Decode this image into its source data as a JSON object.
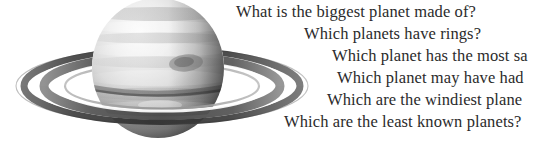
{
  "figure": {
    "illustration": {
      "name": "saturn-planet-with-rings",
      "description": "Grayscale photographic illustration of the ringed gas giant Saturn, body cropped at the top edge, rings tilted and extending to the left and right",
      "colors": {
        "background": "#ffffff",
        "planet_light": "#f2f2f2",
        "planet_mid": "#b8b8b8",
        "planet_dark": "#6e6e6e",
        "planet_shadow": "#4a4a4a",
        "ring_dark": "#3a3a3a",
        "ring_mid": "#7d7d7d",
        "ring_light": "#dcdcdc",
        "text": "#2b2b2b"
      }
    },
    "questions": [
      "What is the biggest planet made of?",
      "Which planets have rings?",
      "Which planet has the most sa",
      "Which planet may have had",
      "Which are the windiest plane",
      "Which are the least known planets?"
    ]
  }
}
